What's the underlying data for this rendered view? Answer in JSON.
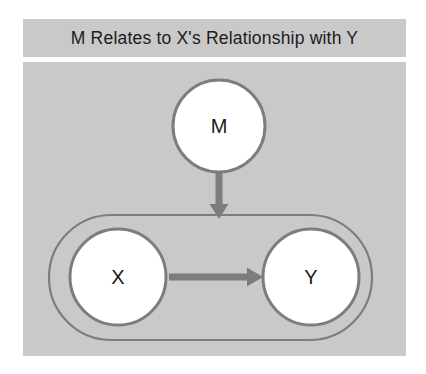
{
  "figure": {
    "title": "M Relates to X's Relationship with Y",
    "background_color": "#ffffff",
    "panel_color": "#c9c9c9",
    "stroke_color": "#7d7d7d",
    "node_fill": "#ffffff",
    "text_color": "#1a1a1a"
  },
  "diagram": {
    "type": "moderation-path-diagram",
    "nodes": [
      {
        "id": "M",
        "label": "M",
        "shape": "circle",
        "cx": 196,
        "cy": 64,
        "r": 47
      },
      {
        "id": "X",
        "label": "X",
        "shape": "circle",
        "cx": 95,
        "cy": 215,
        "r": 49
      },
      {
        "id": "Y",
        "label": "Y",
        "shape": "circle",
        "cx": 288,
        "cy": 215,
        "r": 49
      }
    ],
    "groups": [
      {
        "id": "xy-relationship",
        "shape": "stadium",
        "label": "",
        "x": 25,
        "y": 152,
        "width": 325,
        "height": 127
      }
    ],
    "edges": [
      {
        "id": "m-to-xy",
        "from": "M",
        "to": "xy-relationship",
        "direction": "down",
        "arrowhead": true
      },
      {
        "id": "x-to-y",
        "from": "X",
        "to": "Y",
        "direction": "right",
        "arrowhead": true
      }
    ]
  }
}
